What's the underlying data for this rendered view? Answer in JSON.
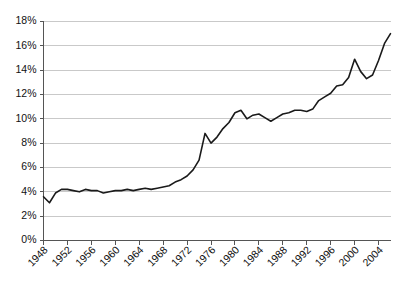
{
  "chart_data": {
    "type": "line",
    "title": "",
    "subtitle": "",
    "xlabel": "",
    "ylabel": "",
    "grid": true,
    "legend": false,
    "legend_position": "none",
    "line_color": "#1a1a1a",
    "grid_color": "#c9c9c9",
    "axis_color": "#555555",
    "background_color": "#ffffff",
    "xlim": [
      1948,
      2006
    ],
    "ylim": [
      0,
      18
    ],
    "ytick_labels": [
      "0%",
      "2%",
      "4%",
      "6%",
      "8%",
      "10%",
      "12%",
      "14%",
      "16%",
      "18%"
    ],
    "ytick_values": [
      0,
      2,
      4,
      6,
      8,
      10,
      12,
      14,
      16,
      18
    ],
    "xtick_labels": [
      "1948",
      "1952",
      "1956",
      "1960",
      "1964",
      "1968",
      "1972",
      "1976",
      "1980",
      "1984",
      "1988",
      "1992",
      "1996",
      "2000",
      "2004"
    ],
    "xtick_values": [
      1948,
      1952,
      1956,
      1960,
      1964,
      1968,
      1972,
      1976,
      1980,
      1984,
      1988,
      1992,
      1996,
      2000,
      2004
    ],
    "xtick_rotation": -45,
    "series": [
      {
        "name": "share",
        "x": [
          1948,
          1949,
          1950,
          1951,
          1952,
          1953,
          1954,
          1955,
          1956,
          1957,
          1958,
          1959,
          1960,
          1961,
          1962,
          1963,
          1964,
          1965,
          1966,
          1967,
          1968,
          1969,
          1970,
          1971,
          1972,
          1973,
          1974,
          1975,
          1976,
          1977,
          1978,
          1979,
          1980,
          1981,
          1982,
          1983,
          1984,
          1985,
          1986,
          1987,
          1988,
          1989,
          1990,
          1991,
          1992,
          1993,
          1994,
          1995,
          1996,
          1997,
          1998,
          1999,
          2000,
          2001,
          2002,
          2003,
          2004,
          2005,
          2006
        ],
        "values": [
          3.6,
          3.1,
          3.9,
          4.2,
          4.2,
          4.1,
          4.0,
          4.2,
          4.1,
          4.1,
          3.9,
          4.0,
          4.1,
          4.1,
          4.2,
          4.1,
          4.2,
          4.3,
          4.2,
          4.3,
          4.4,
          4.5,
          4.8,
          5.0,
          5.3,
          5.8,
          6.6,
          8.8,
          8.0,
          8.5,
          9.2,
          9.7,
          10.5,
          10.7,
          10.0,
          10.3,
          10.4,
          10.1,
          9.8,
          10.1,
          10.4,
          10.5,
          10.7,
          10.7,
          10.6,
          10.8,
          11.5,
          11.8,
          12.1,
          12.7,
          12.8,
          13.4,
          14.9,
          13.9,
          13.3,
          13.6,
          14.8,
          16.2,
          17.0
        ],
        "color": "#1a1a1a"
      }
    ]
  }
}
